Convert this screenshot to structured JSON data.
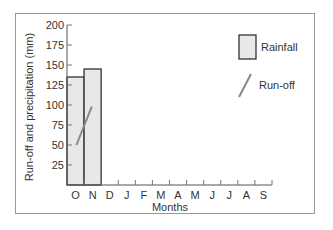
{
  "chart_data": {
    "type": "bar",
    "title": "",
    "xlabel": "Months",
    "ylabel": "Run-off and precipitation (mm)",
    "ylim": [
      0,
      200
    ],
    "yticks": [
      25,
      50,
      75,
      100,
      125,
      150,
      175,
      200
    ],
    "categories": [
      "O",
      "N",
      "D",
      "J",
      "F",
      "M",
      "A",
      "M",
      "J",
      "J",
      "A",
      "S"
    ],
    "series": [
      {
        "name": "Rainfall",
        "type": "bar",
        "values": [
          135,
          145,
          null,
          null,
          null,
          null,
          null,
          null,
          null,
          null,
          null,
          null
        ],
        "color": "#e8e8e8"
      },
      {
        "name": "Run-off",
        "type": "line",
        "points": [
          {
            "x": "O",
            "y": 50
          },
          {
            "x": "O/N",
            "y": 98
          }
        ],
        "color": "#888888"
      }
    ],
    "legend": {
      "position": "top-right",
      "entries": [
        "Rainfall",
        "Run-off"
      ]
    },
    "grid": false
  },
  "labels": {
    "xlabel": "Months",
    "ylabel": "Run-off and precipitation (mm)",
    "legend_rainfall": "Rainfall",
    "legend_runoff": "Run-off"
  }
}
